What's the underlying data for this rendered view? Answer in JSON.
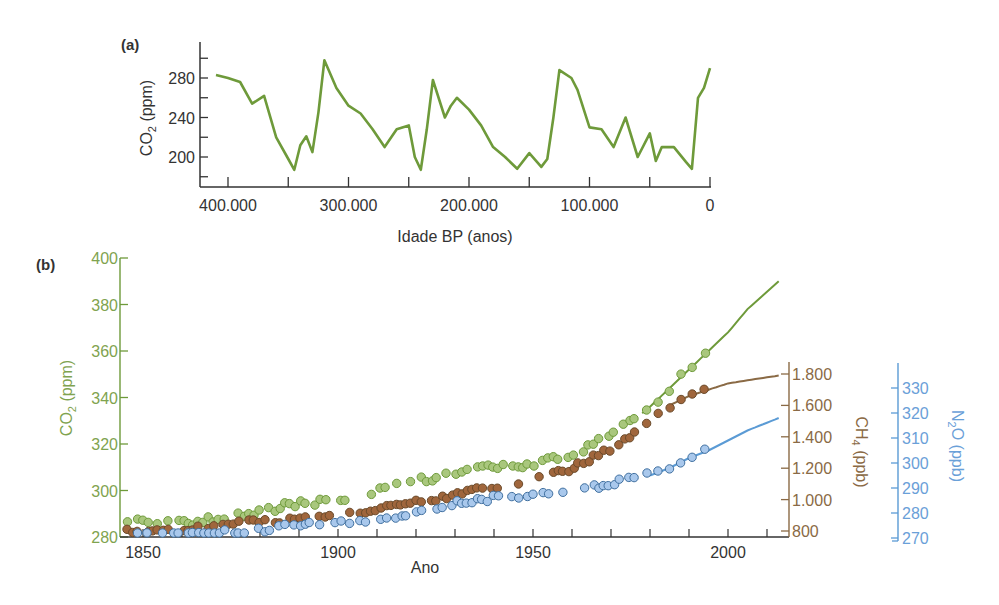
{
  "panel_a": {
    "label": "(a)",
    "ylabel_main": "CO",
    "ylabel_sub": "2",
    "ylabel_unit": " (ppm)",
    "xlabel": "Idade BP (anos)",
    "yticks": [
      "280",
      "240",
      "200"
    ],
    "xticks": [
      "400.000",
      "300.000",
      "200.000",
      "100.000",
      "0"
    ]
  },
  "panel_b": {
    "label": "(b)",
    "xlabel": "Ano",
    "xticks": [
      "1850",
      "1900",
      "1950",
      "2000"
    ],
    "co2_axis": {
      "label_main": "CO",
      "label_sub": "2",
      "label_unit": " (ppm)",
      "ticks": [
        "400",
        "380",
        "360",
        "340",
        "320",
        "300",
        "280"
      ]
    },
    "ch4_axis": {
      "label_main": "CH",
      "label_sub": "4",
      "label_unit": " (ppb)",
      "ticks": [
        "1.800",
        "1.600",
        "1.400",
        "1.200",
        "1.000",
        "800"
      ]
    },
    "n2o_axis": {
      "label_main": "N",
      "label_sub": "2",
      "label_unit": "O (ppb)",
      "ticks": [
        "330",
        "320",
        "310",
        "300",
        "290",
        "280",
        "270"
      ]
    }
  },
  "colors": {
    "co2": "#6e9a3a",
    "co2_fill": "#a9c77d",
    "ch4": "#8a6a45",
    "ch4_fill": "#a0663c",
    "n2o": "#5b9bd5",
    "n2o_fill": "#a9c8ec",
    "axis": "#333333",
    "text": "#333333"
  },
  "chart_data": [
    {
      "type": "line",
      "title": "(a)",
      "xlabel": "Idade BP (anos)",
      "ylabel": "CO2 (ppm)",
      "xlim": [
        400000,
        0
      ],
      "ylim": [
        180,
        300
      ],
      "x_ticks": [
        400000,
        300000,
        200000,
        100000,
        0
      ],
      "y_ticks": [
        200,
        240,
        280
      ],
      "series": [
        {
          "name": "CO2",
          "x": [
            410000,
            400000,
            390000,
            380000,
            370000,
            360000,
            350000,
            345000,
            340000,
            335000,
            330000,
            325000,
            320000,
            310000,
            300000,
            290000,
            280000,
            270000,
            260000,
            250000,
            245000,
            240000,
            235000,
            230000,
            220000,
            215000,
            210000,
            200000,
            190000,
            180000,
            170000,
            160000,
            150000,
            140000,
            135000,
            130000,
            125000,
            115000,
            110000,
            100000,
            90000,
            80000,
            70000,
            60000,
            50000,
            45000,
            40000,
            30000,
            20000,
            15000,
            10000,
            5000,
            0
          ],
          "values": [
            283,
            280,
            276,
            254,
            262,
            220,
            198,
            187,
            212,
            221,
            205,
            245,
            298,
            270,
            252,
            244,
            228,
            210,
            228,
            232,
            200,
            187,
            228,
            278,
            240,
            252,
            260,
            248,
            232,
            210,
            200,
            188,
            204,
            190,
            198,
            240,
            288,
            280,
            268,
            230,
            228,
            210,
            240,
            200,
            224,
            196,
            210,
            210,
            195,
            188,
            260,
            270,
            290
          ]
        }
      ]
    },
    {
      "type": "scatter",
      "title": "(b)",
      "xlabel": "Ano",
      "xlim": [
        1845,
        2015
      ],
      "x_ticks": [
        1850,
        1900,
        1950,
        2000
      ],
      "axes": [
        {
          "name": "CO2 (ppm)",
          "ylim": [
            280,
            400
          ],
          "ticks": [
            280,
            300,
            320,
            340,
            360,
            380,
            400
          ],
          "position": "left"
        },
        {
          "name": "CH4 (ppb)",
          "ylim": [
            800,
            1800
          ],
          "ticks": [
            800,
            1000,
            1200,
            1400,
            1600,
            1800
          ],
          "position": "right"
        },
        {
          "name": "N2O (ppb)",
          "ylim": [
            270,
            335
          ],
          "ticks": [
            270,
            280,
            290,
            300,
            310,
            320,
            330
          ],
          "position": "right-outer"
        }
      ],
      "series": [
        {
          "name": "CO2 (ppm)",
          "axis": "CO2 (ppm)",
          "x": [
            1845,
            1850,
            1855,
            1860,
            1865,
            1870,
            1875,
            1880,
            1885,
            1890,
            1895,
            1900,
            1905,
            1910,
            1915,
            1920,
            1925,
            1930,
            1935,
            1940,
            1945,
            1950,
            1955,
            1960,
            1965,
            1970,
            1975,
            1980,
            1985,
            1990,
            1995,
            2000,
            2005,
            2013
          ],
          "values": [
            285,
            287,
            286,
            286,
            287,
            288,
            289,
            291,
            293,
            294,
            295,
            296,
            298,
            300,
            302,
            304,
            305,
            307,
            310,
            311,
            311,
            311,
            313,
            316,
            319,
            324,
            329,
            336,
            344,
            352,
            360,
            368,
            378,
            390
          ]
        },
        {
          "name": "CH4 (ppb)",
          "axis": "CH4 (ppb)",
          "x": [
            1845,
            1850,
            1860,
            1870,
            1880,
            1890,
            1900,
            1910,
            1920,
            1930,
            1940,
            1950,
            1960,
            1970,
            1975,
            1980,
            1985,
            1990,
            1995,
            2000,
            2005,
            2013
          ],
          "values": [
            800,
            800,
            810,
            840,
            860,
            870,
            900,
            940,
            980,
            1030,
            1080,
            1120,
            1200,
            1330,
            1400,
            1520,
            1600,
            1660,
            1700,
            1740,
            1760,
            1790
          ]
        },
        {
          "name": "N2O (ppb)",
          "axis": "N2O (ppb)",
          "x": [
            1845,
            1850,
            1860,
            1870,
            1880,
            1890,
            1900,
            1910,
            1920,
            1930,
            1940,
            1950,
            1960,
            1970,
            1975,
            1980,
            1985,
            1990,
            1995,
            2000,
            2005,
            2013
          ],
          "values": [
            270,
            271,
            271,
            272,
            273,
            275,
            276,
            278,
            280,
            284,
            286,
            287,
            289,
            292,
            294,
            295,
            298,
            302,
            305,
            309,
            313,
            318
          ]
        }
      ]
    }
  ]
}
